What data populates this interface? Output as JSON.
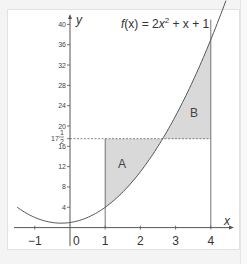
{
  "chart_data": {
    "type": "area",
    "title": "",
    "function_label": {
      "prefix_italic": "f",
      "prefix_rest": "(x) = 2",
      "x1": "x",
      "exp": "2",
      "rest": " + x + 1"
    },
    "function": {
      "a": 2,
      "b": 1,
      "c": 1,
      "expression": "f(x) = 2x^2 + x + 1"
    },
    "xlabel": "x",
    "ylabel": "y",
    "xlim": [
      -1.55,
      4.7
    ],
    "ylim": [
      -4,
      42
    ],
    "x_ticks": [
      {
        "value": -1,
        "label": "−1"
      },
      {
        "value": 0,
        "label": "0"
      },
      {
        "value": 1,
        "label": "1"
      },
      {
        "value": 2,
        "label": "2"
      },
      {
        "value": 3,
        "label": "3"
      },
      {
        "value": 4,
        "label": "4"
      }
    ],
    "y_ticks": [
      {
        "value": 4,
        "label": "4"
      },
      {
        "value": 8,
        "label": "8"
      },
      {
        "value": 12,
        "label": "12"
      },
      {
        "value": 16,
        "label": "16"
      },
      {
        "value": 20,
        "label": "20"
      },
      {
        "value": 24,
        "label": "24"
      },
      {
        "value": 28,
        "label": "28"
      },
      {
        "value": 32,
        "label": "32"
      },
      {
        "value": 36,
        "label": "36"
      },
      {
        "value": 40,
        "label": "40"
      }
    ],
    "special_y": {
      "value": 17.5,
      "whole": "17",
      "num": "1",
      "den": "2"
    },
    "vertical_lines": [
      1,
      4
    ],
    "regions": [
      {
        "name": "A",
        "label": "A",
        "description": "between x=1, y=17.5 and the curve (below line, above curve)"
      },
      {
        "name": "B",
        "label": "B",
        "description": "between curve, y=17.5 and x=4 (above line, below curve)"
      }
    ],
    "shade_color": "#d9d9d9",
    "curve_color": "#555555",
    "grid": false,
    "legend": "none"
  }
}
